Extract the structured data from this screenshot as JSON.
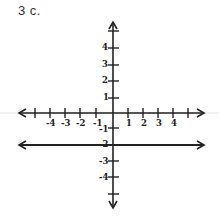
{
  "problem": {
    "label": "3 c."
  },
  "graph": {
    "x_axis": {
      "ticks_negative": [
        "-4",
        "-3",
        "-2",
        "-1"
      ],
      "ticks_positive": [
        "1",
        "2",
        "3",
        "4"
      ]
    },
    "y_axis": {
      "ticks_positive": [
        "4",
        "3",
        "2",
        "1"
      ],
      "ticks_negative": [
        "-1",
        "-2",
        "-3",
        "-4"
      ]
    },
    "line": {
      "description": "horizontal line y = -2",
      "y_value": -2
    }
  },
  "colors": {
    "ink": "#222222",
    "faint_line": "#dddddd"
  }
}
